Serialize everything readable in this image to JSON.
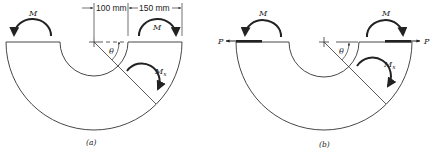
{
  "figures": [
    {
      "id": "a",
      "caption": "(a)",
      "moment_left": "M",
      "moment_right": "M",
      "section_moment": "M",
      "section_moment_sub": "x",
      "angle": "θ",
      "dimensions": {
        "inner_radius": "100 mm",
        "thickness": "150 mm"
      }
    },
    {
      "id": "b",
      "caption": "(b)",
      "moment_left": "M",
      "moment_right": "M",
      "force_left": "P",
      "force_right": "P",
      "section_moment": "M",
      "section_moment_sub": "x",
      "angle": "θ"
    }
  ],
  "colors": {
    "line": "#333333",
    "arrow": "#222222",
    "background": "#ffffff"
  }
}
